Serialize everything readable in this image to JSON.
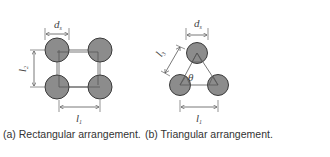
{
  "figure": {
    "panels": [
      {
        "id": "a",
        "caption": "(a) Rectangular arrangement.",
        "labels": {
          "diameter": "d",
          "diameter_sub": "s",
          "vertical_spacing": "l",
          "vertical_sub": "2",
          "horizontal_spacing": "l",
          "horizontal_sub": "1"
        }
      },
      {
        "id": "b",
        "caption": "(b) Triangular arrangement.",
        "labels": {
          "diameter": "d",
          "diameter_sub": "s",
          "diagonal_spacing": "l",
          "diagonal_sub": "3",
          "horizontal_spacing": "l",
          "horizontal_sub": "1",
          "angle": "θ"
        }
      }
    ],
    "colors": {
      "circle_fill": "#8c8c8c",
      "circle_stroke": "#3a3a3a",
      "line": "#555555"
    }
  }
}
